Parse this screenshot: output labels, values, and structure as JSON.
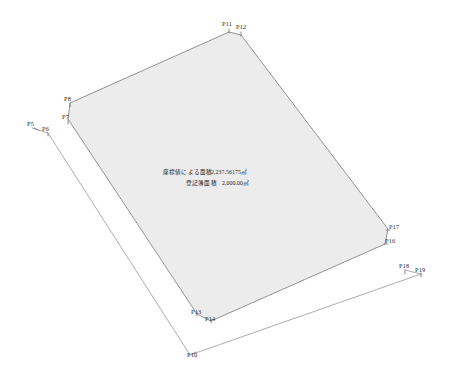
{
  "drawing": {
    "title": "地積測量図",
    "background_color": "#ffffff",
    "parcel_fill_color": "#ececed",
    "line_color": "#8a8a8a"
  },
  "annotations": {
    "coordinate_area_label": "座標値による面積",
    "coordinate_area_value": "2,237.56175㎡",
    "registry_area_label": "登記簿面積",
    "registry_area_value": "2,000.00㎡"
  },
  "parcel": {
    "name": "main-parcel-polygon",
    "vertices": [
      {
        "id": "P8",
        "x": 70,
        "y": 103
      },
      {
        "id": "P11",
        "x": 229,
        "y": 32
      },
      {
        "id": "P12",
        "x": 241,
        "y": 35
      },
      {
        "id": "P17",
        "x": 388,
        "y": 229
      },
      {
        "id": "P16",
        "x": 385,
        "y": 244
      },
      {
        "id": "P14",
        "x": 211,
        "y": 321
      },
      {
        "id": "P13",
        "x": 197,
        "y": 314
      },
      {
        "id": "P7",
        "x": 68,
        "y": 119
      }
    ]
  },
  "outer_boundary": {
    "name": "outer-offset-boundary",
    "segments": [
      {
        "from": {
          "x": 32,
          "y": 128
        },
        "to": {
          "x": 48,
          "y": 133
        }
      },
      {
        "from": {
          "x": 48,
          "y": 133
        },
        "to": {
          "x": 190,
          "y": 355
        }
      },
      {
        "from": {
          "x": 190,
          "y": 355
        },
        "to": {
          "x": 421,
          "y": 274
        }
      },
      {
        "from": {
          "x": 405,
          "y": 270
        },
        "to": {
          "x": 421,
          "y": 274
        }
      }
    ]
  },
  "point_labels": [
    {
      "id": "P5",
      "text": "P5",
      "x": 27,
      "y": 126,
      "tick": {
        "x1": 34,
        "y1": 128,
        "x2": 38,
        "y2": 130
      }
    },
    {
      "id": "P6",
      "text": "P6",
      "x": 42,
      "y": 131,
      "tick": {
        "x1": 48,
        "y1": 133,
        "x2": 48,
        "y2": 136
      }
    },
    {
      "id": "P7",
      "text": "P7",
      "x": 62,
      "y": 119,
      "tick": {
        "x1": 68,
        "y1": 120,
        "x2": 68,
        "y2": 124
      }
    },
    {
      "id": "P8",
      "text": "P8",
      "x": 64,
      "y": 101,
      "tick": {
        "x1": 70,
        "y1": 103,
        "x2": 70,
        "y2": 107
      }
    },
    {
      "id": "P10",
      "text": "P10",
      "x": 187,
      "y": 357,
      "tick": {
        "x1": 192,
        "y1": 354,
        "x2": 196,
        "y2": 352
      }
    },
    {
      "id": "P11",
      "text": "P11",
      "x": 222,
      "y": 26,
      "tick": {
        "x1": 229,
        "y1": 29,
        "x2": 229,
        "y2": 33
      }
    },
    {
      "id": "P12",
      "text": "P12",
      "x": 236,
      "y": 29,
      "tick": {
        "x1": 241,
        "y1": 32,
        "x2": 241,
        "y2": 36
      }
    },
    {
      "id": "P13",
      "text": "P13",
      "x": 191,
      "y": 314,
      "tick": {
        "x1": 197,
        "y1": 312,
        "x2": 197,
        "y2": 316
      }
    },
    {
      "id": "P14",
      "text": "P14",
      "x": 205,
      "y": 321,
      "tick": {
        "x1": 211,
        "y1": 319,
        "x2": 211,
        "y2": 323
      }
    },
    {
      "id": "P16",
      "text": "P16",
      "x": 385,
      "y": 243,
      "tick": {
        "x1": 384,
        "y1": 244,
        "x2": 388,
        "y2": 244
      }
    },
    {
      "id": "P17",
      "text": "P17",
      "x": 389,
      "y": 229,
      "tick": {
        "x1": 386,
        "y1": 230,
        "x2": 390,
        "y2": 230
      }
    },
    {
      "id": "P18",
      "text": "P18",
      "x": 399,
      "y": 268,
      "tick": {
        "x1": 405,
        "y1": 270,
        "x2": 405,
        "y2": 274
      }
    },
    {
      "id": "P19",
      "text": "P19",
      "x": 415,
      "y": 272,
      "tick": {
        "x1": 421,
        "y1": 273,
        "x2": 421,
        "y2": 277
      }
    }
  ]
}
